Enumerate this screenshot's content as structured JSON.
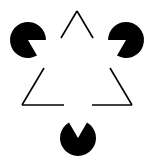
{
  "figure": {
    "title": "Kanizsa Triangle",
    "width": 154,
    "height": 167,
    "background_color": "#ffffff",
    "ink_color": "#000000"
  },
  "inducers": {
    "name": "pacman-discs",
    "radius": 18,
    "fill": "#000000",
    "items": [
      {
        "id": "pacman-top-left",
        "label": "top-left-pacman",
        "cx": 28,
        "cy": 40,
        "wedge_start_deg": 0,
        "wedge_end_deg": 60,
        "notch_direction": "right-down"
      },
      {
        "id": "pacman-top-right",
        "label": "top-right-pacman",
        "cx": 126,
        "cy": 40,
        "wedge_start_deg": 120,
        "wedge_end_deg": 180,
        "notch_direction": "left-down"
      },
      {
        "id": "pacman-bottom",
        "label": "bottom-pacman",
        "cx": 78,
        "cy": 138,
        "wedge_start_deg": 240,
        "wedge_end_deg": 300,
        "notch_direction": "up"
      }
    ]
  },
  "outline_triangle": {
    "name": "outlined-triangle",
    "stroke": "#000000",
    "stroke_width": 1.6,
    "fill": "none",
    "orientation": "apex-up",
    "vertices": [
      {
        "id": "apex",
        "x": 77,
        "y": 11
      },
      {
        "id": "bottom-left",
        "x": 22,
        "y": 105
      },
      {
        "id": "bottom-right",
        "x": 132,
        "y": 105
      }
    ],
    "gap_note": "each edge is interrupted near its midpoint by the illusory triangle",
    "segments": [
      {
        "id": "left-edge-upper",
        "x1": 77,
        "y1": 11,
        "x2": 61,
        "y2": 38
      },
      {
        "id": "left-edge-lower",
        "x1": 44,
        "y1": 68,
        "x2": 22,
        "y2": 105
      },
      {
        "id": "right-edge-upper",
        "x1": 77,
        "y1": 11,
        "x2": 93,
        "y2": 38
      },
      {
        "id": "right-edge-lower",
        "x1": 110,
        "y1": 68,
        "x2": 132,
        "y2": 105
      },
      {
        "id": "bottom-edge-left",
        "x1": 22,
        "y1": 105,
        "x2": 64,
        "y2": 105
      },
      {
        "id": "bottom-edge-right",
        "x1": 92,
        "y1": 105,
        "x2": 132,
        "y2": 105
      }
    ]
  },
  "illusory_triangle": {
    "name": "illusory-triangle",
    "orientation": "apex-down",
    "visible": false,
    "vertices": [
      {
        "id": "left",
        "x": 28,
        "y": 40
      },
      {
        "id": "right",
        "x": 126,
        "y": 40
      },
      {
        "id": "apex-down",
        "x": 78,
        "y": 138
      }
    ]
  }
}
